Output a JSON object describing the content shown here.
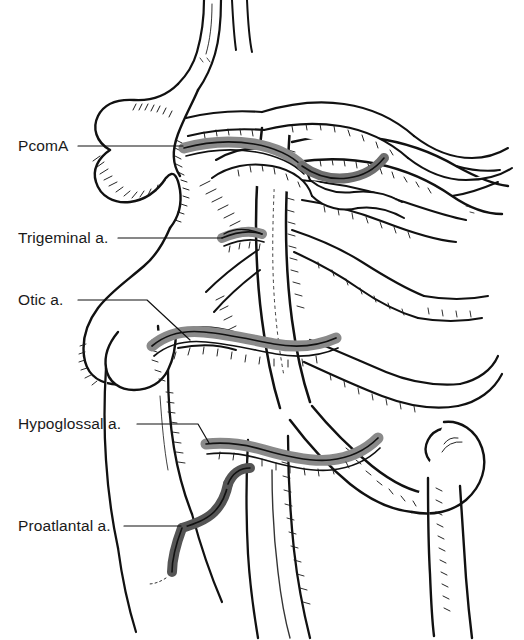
{
  "figure": {
    "background_color": "#ffffff",
    "ink_color": "#111111",
    "shaded_vessel_color": "#8a8a8a",
    "shaded_vessel_dark_color": "#5a5a5a"
  },
  "labels": [
    {
      "id": "pcoma",
      "text": "PcomA",
      "x": 18,
      "y": 138
    },
    {
      "id": "trigeminal",
      "text": "Trigeminal a.",
      "x": 18,
      "y": 230
    },
    {
      "id": "otic",
      "text": "Otic a.",
      "x": 18,
      "y": 292
    },
    {
      "id": "hypoglossal",
      "text": "Hypoglossal a.",
      "x": 18,
      "y": 416
    },
    {
      "id": "proatlantal",
      "text": "Proatlantal a.",
      "x": 18,
      "y": 518
    }
  ],
  "leaders": [
    {
      "id": "pcoma",
      "points": "78,146 183,146"
    },
    {
      "id": "trigeminal",
      "points": "118,238 222,238"
    },
    {
      "id": "otic",
      "points": "78,300 147,300 190,340"
    },
    {
      "id": "hypoglossal",
      "points": "137,424 198,424 209,443"
    },
    {
      "id": "proatlantal",
      "points": "124,526 181,526"
    }
  ],
  "vessels": {
    "shaded": [
      "posterior communicating artery segment",
      "trigeminal artery",
      "otic artery",
      "hypoglossal artery",
      "proatlantal artery"
    ],
    "outline": [
      "internal carotid artery",
      "basilar artery",
      "vertebral artery",
      "anterior cerebral artery",
      "middle cerebral artery",
      "posterior cerebral artery",
      "superior cerebellar artery",
      "external carotid branches",
      "common carotid artery",
      "subclavian artery"
    ]
  }
}
